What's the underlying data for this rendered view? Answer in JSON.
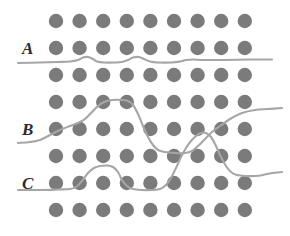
{
  "figure": {
    "background_color": "#ffffff",
    "width": 290,
    "height": 236,
    "dot_color": "#7b7b7b",
    "curve_color": "#a6a6a6",
    "label_color": "#2b2b2b",
    "dot_radius": 7.2,
    "curve_width": 2.1
  },
  "labels": [
    {
      "text": "A",
      "x": 22,
      "y": 40,
      "name": "row-label-a"
    },
    {
      "text": "B",
      "x": 22,
      "y": 121,
      "name": "row-label-b"
    },
    {
      "text": "C",
      "x": 22,
      "y": 175,
      "name": "row-label-c"
    }
  ],
  "lattice": {
    "columns": 9,
    "rows": 8,
    "x_start": 56,
    "x_step": 23.6,
    "y_values": [
      21,
      48,
      75,
      102,
      129,
      156,
      183,
      210
    ],
    "row_names": [
      "dot-row-1",
      "dot-row-2",
      "dot-row-3",
      "dot-row-4",
      "dot-row-5",
      "dot-row-6",
      "dot-row-7",
      "dot-row-8"
    ]
  },
  "curves": [
    {
      "id": "curve-a",
      "name": "trajectory-curve-a",
      "label": "A",
      "points": [
        [
          18,
          63
        ],
        [
          40,
          62.5
        ],
        [
          58,
          62
        ],
        [
          70,
          61.5
        ],
        [
          78,
          60
        ],
        [
          83,
          57.5
        ],
        [
          88,
          57
        ],
        [
          93,
          59
        ],
        [
          97,
          61.5
        ],
        [
          104,
          62.5
        ],
        [
          115,
          62.5
        ],
        [
          122,
          62
        ],
        [
          128,
          60
        ],
        [
          133,
          57.5
        ],
        [
          139,
          57
        ],
        [
          144,
          59
        ],
        [
          150,
          61.5
        ],
        [
          158,
          62.5
        ],
        [
          172,
          62.5
        ],
        [
          180,
          61.5
        ],
        [
          186,
          60
        ],
        [
          193,
          59.5
        ],
        [
          204,
          60
        ],
        [
          225,
          60
        ],
        [
          250,
          59.5
        ],
        [
          272,
          59.5
        ]
      ]
    },
    {
      "id": "curve-b",
      "name": "trajectory-curve-b",
      "label": "B",
      "points": [
        [
          18,
          143
        ],
        [
          30,
          142
        ],
        [
          40,
          140
        ],
        [
          50,
          135
        ],
        [
          60,
          130
        ],
        [
          70,
          126
        ],
        [
          78,
          123
        ],
        [
          85,
          119
        ],
        [
          92,
          112
        ],
        [
          98,
          106
        ],
        [
          104,
          102
        ],
        [
          112,
          100
        ],
        [
          122,
          100
        ],
        [
          128,
          101
        ],
        [
          133,
          105
        ],
        [
          138,
          114
        ],
        [
          143,
          126
        ],
        [
          148,
          137
        ],
        [
          153,
          145
        ],
        [
          158,
          150
        ],
        [
          165,
          152
        ],
        [
          175,
          153
        ],
        [
          185,
          153
        ],
        [
          192,
          151
        ],
        [
          198,
          146
        ],
        [
          205,
          139
        ],
        [
          212,
          132
        ],
        [
          220,
          126
        ],
        [
          230,
          119
        ],
        [
          242,
          113
        ],
        [
          255,
          110
        ],
        [
          268,
          109
        ],
        [
          282,
          108
        ]
      ]
    },
    {
      "id": "curve-c",
      "name": "trajectory-curve-c",
      "label": "C",
      "points": [
        [
          18,
          190
        ],
        [
          40,
          190
        ],
        [
          58,
          189.5
        ],
        [
          70,
          189
        ],
        [
          76,
          187
        ],
        [
          82,
          181
        ],
        [
          88,
          173
        ],
        [
          94,
          168
        ],
        [
          100,
          166
        ],
        [
          107,
          165.5
        ],
        [
          113,
          167
        ],
        [
          118,
          172
        ],
        [
          122,
          180
        ],
        [
          127,
          186
        ],
        [
          133,
          189
        ],
        [
          142,
          190
        ],
        [
          152,
          190
        ],
        [
          160,
          189
        ],
        [
          166,
          185
        ],
        [
          171,
          178
        ],
        [
          176,
          168
        ],
        [
          181,
          157
        ],
        [
          186,
          148
        ],
        [
          191,
          141
        ],
        [
          196,
          136
        ],
        [
          201,
          133
        ],
        [
          206,
          133
        ],
        [
          211,
          137
        ],
        [
          216,
          146
        ],
        [
          221,
          157
        ],
        [
          226,
          166
        ],
        [
          231,
          172
        ],
        [
          237,
          175
        ],
        [
          246,
          176
        ],
        [
          255,
          176
        ],
        [
          263,
          175
        ],
        [
          272,
          173
        ],
        [
          282,
          172
        ]
      ]
    }
  ]
}
